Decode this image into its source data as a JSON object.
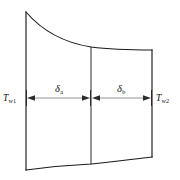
{
  "figure": {
    "kind": "technical-line-diagram",
    "background_color": "#ffffff",
    "outline_color": "#1a1a1a",
    "dimension_line_color": "#8a8a8a",
    "text_color": "#111111",
    "canvas": {
      "width": 180,
      "height": 180
    }
  },
  "labels": {
    "left_temperature": {
      "symbol": "T",
      "subscript": "w1",
      "full": "Tw1"
    },
    "right_temperature": {
      "symbol": "T",
      "subscript": "w2",
      "full": "Tw2"
    },
    "left_thickness": {
      "symbol": "δ",
      "subscript": "a",
      "full": "δa"
    },
    "right_thickness": {
      "symbol": "δ",
      "subscript": "b",
      "full": "δb"
    }
  },
  "geometry": {
    "left_edge_x": 26,
    "mid_edge_x": 91,
    "right_edge_x": 152,
    "left_edge_top_y": 12,
    "left_edge_bottom_y": 170,
    "mid_edge_top_y": 47,
    "mid_edge_bottom_y": 164,
    "right_edge_top_y": 50,
    "right_edge_bottom_y": 157,
    "dimension_line_y": 98,
    "top_curve": "M 26 12 C 44 33, 66 43, 91 47 C 114 50, 134 50, 152 50",
    "bottom_curve": "M 26 170 C 48 167, 70 165, 91 164 C 112 162, 134 159, 152 157"
  },
  "dimensions": [
    {
      "name": "delta-a",
      "from_x": 26,
      "to_x": 91,
      "y": 98,
      "label_x": 58,
      "label_y": 92
    },
    {
      "name": "delta-b",
      "from_x": 91,
      "to_x": 152,
      "y": 98,
      "label_x": 121,
      "label_y": 92
    }
  ]
}
